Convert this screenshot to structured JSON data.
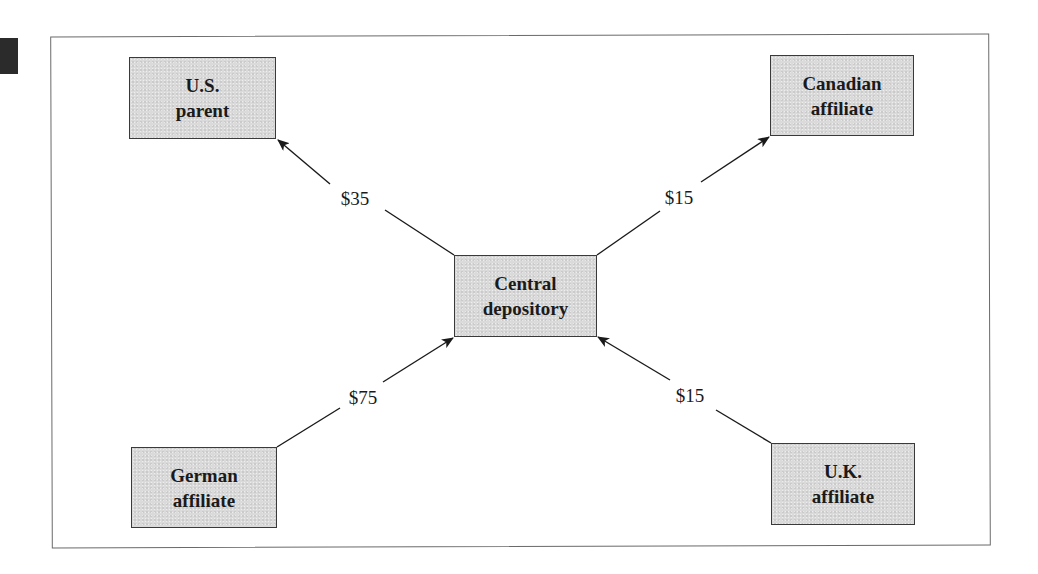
{
  "diagram": {
    "type": "flow",
    "nodes": [
      {
        "id": "us_parent",
        "lines": [
          "U.S.",
          "parent"
        ],
        "x": 129,
        "y": 57,
        "w": 147,
        "h": 82
      },
      {
        "id": "canadian_affiliate",
        "lines": [
          "Canadian",
          "affiliate"
        ],
        "x": 770,
        "y": 55,
        "w": 144,
        "h": 81
      },
      {
        "id": "central_depository",
        "lines": [
          "Central",
          "depository"
        ],
        "x": 454,
        "y": 255,
        "w": 143,
        "h": 82
      },
      {
        "id": "german_affiliate",
        "lines": [
          "German",
          "affiliate"
        ],
        "x": 131,
        "y": 447,
        "w": 146,
        "h": 81
      },
      {
        "id": "uk_affiliate",
        "lines": [
          "U.K.",
          "affiliate"
        ],
        "x": 771,
        "y": 443,
        "w": 144,
        "h": 82
      }
    ],
    "edges": [
      {
        "from": "central_depository",
        "to": "us_parent",
        "label": "$35",
        "amount": 35,
        "label_x": 355,
        "label_y": 199
      },
      {
        "from": "central_depository",
        "to": "canadian_affiliate",
        "label": "$15",
        "amount": 15,
        "label_x": 679,
        "label_y": 198
      },
      {
        "from": "german_affiliate",
        "to": "central_depository",
        "label": "$75",
        "amount": 75,
        "label_x": 363,
        "label_y": 398
      },
      {
        "from": "uk_affiliate",
        "to": "central_depository",
        "label": "$15",
        "amount": 15,
        "label_x": 690,
        "label_y": 396
      }
    ]
  },
  "colors": {
    "node_fill": "#dadada",
    "node_border": "#3a3a3a",
    "edge": "#1a1a1a",
    "frame": "#6a6a6a",
    "text": "#1a1a1a"
  }
}
